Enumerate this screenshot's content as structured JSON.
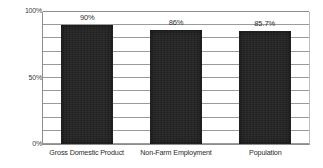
{
  "chart_data": {
    "type": "bar",
    "title": "",
    "subtitle": "",
    "xlabel": "",
    "ylabel": "",
    "categories": [
      "Gross Domestic Product",
      "Non-Farm Employment",
      "Population"
    ],
    "values": [
      90,
      86,
      85.7
    ],
    "value_labels": [
      "90%",
      "86%",
      "85.7%"
    ],
    "ylim": [
      0,
      100
    ],
    "ytick_labels": [
      "0%",
      "50%",
      "100%"
    ],
    "ytick_values": [
      0,
      50,
      100
    ],
    "gridline_interval": 10,
    "gridline_count": 10,
    "grid": true,
    "legend": "none",
    "series": [
      {
        "name": "",
        "values": [
          90,
          86,
          85.7
        ]
      }
    ],
    "colors": {
      "bar": "#232323",
      "gridline": "#9a9a9a",
      "axis": "#8d8d8d",
      "text": "#2b2b2b",
      "background": "#ffffff"
    }
  },
  "axis": {
    "y": {
      "top_label": "100%",
      "mid_label": "50%",
      "bottom_label": "0%"
    }
  },
  "bars": [
    {
      "label": "Gross Domestic Product",
      "value_label": "90%"
    },
    {
      "label": "Non-Farm Employment",
      "value_label": "86%"
    },
    {
      "label": "Population",
      "value_label": "85.7%"
    }
  ]
}
